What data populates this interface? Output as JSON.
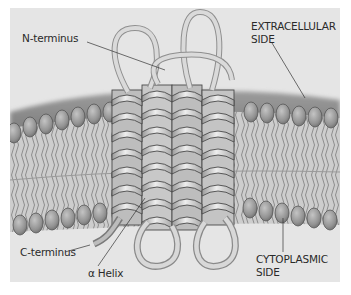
{
  "figure": {
    "labels": {
      "n_terminus": "N-terminus",
      "extracellular_line1": "EXTRACELLULAR",
      "extracellular_line2": "SIDE",
      "c_terminus": "C-terminus",
      "alpha_helix": "α Helix",
      "cytoplasmic_line1": "CYTOPLASMIC",
      "cytoplasmic_line2": "SIDE"
    },
    "colors": {
      "background": "#e5e5e5",
      "membrane_surface": "#8c8c8c",
      "lipid_head": "#9a9a9a",
      "lipid_head_outline": "#5a5a5a",
      "lipid_tail": "#cfcfcf",
      "ribbon_light": "#d9d9d9",
      "ribbon_dark": "#8a8a8a",
      "outline": "#4a4a4a",
      "leader_line": "#333333"
    },
    "helix_count": 4
  }
}
